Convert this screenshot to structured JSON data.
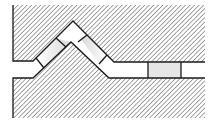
{
  "diagram": {
    "type": "cross-section",
    "colors": {
      "background": "#ffffff",
      "line": "#1a1a1a",
      "hatch": "#555555",
      "seal_shade": "#d9d9d9"
    },
    "parts": [
      {
        "name": "upper-body",
        "fill": "hatched"
      },
      {
        "name": "lower-body",
        "fill": "hatched"
      },
      {
        "name": "seal-left-slope",
        "fill": "shaded"
      },
      {
        "name": "seal-apex",
        "fill": "white"
      },
      {
        "name": "seal-right-slope",
        "fill": "shaded"
      },
      {
        "name": "seal-channel-rect",
        "fill": "shaded"
      }
    ],
    "labels": []
  }
}
